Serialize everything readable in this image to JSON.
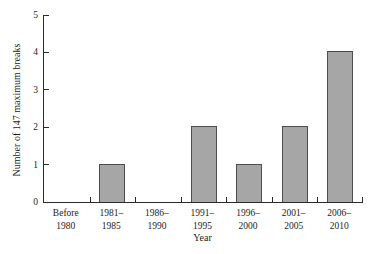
{
  "chart_data": {
    "type": "bar",
    "title": "",
    "xlabel": "Year",
    "ylabel": "Number of 147 maximum breaks",
    "categories": [
      {
        "line1": "Before",
        "line2": "1980"
      },
      {
        "line1": "1981–",
        "line2": "1985"
      },
      {
        "line1": "1986–",
        "line2": "1990"
      },
      {
        "line1": "1991–",
        "line2": "1995"
      },
      {
        "line1": "1996–",
        "line2": "2000"
      },
      {
        "line1": "2001–",
        "line2": "2005"
      },
      {
        "line1": "2006–",
        "line2": "2010"
      }
    ],
    "values": [
      0,
      1,
      0,
      2,
      1,
      2,
      4
    ],
    "ylim": [
      0,
      5
    ],
    "yticks": [
      0,
      1,
      2,
      3,
      4,
      5
    ],
    "grid": false,
    "legend_position": "none",
    "colors": {
      "bar_fill": "#a6a6a6",
      "bar_border": "#4d4d4d",
      "axis": "#2b2b2b",
      "text": "#1c1c1c",
      "background": "#ffffff"
    }
  }
}
